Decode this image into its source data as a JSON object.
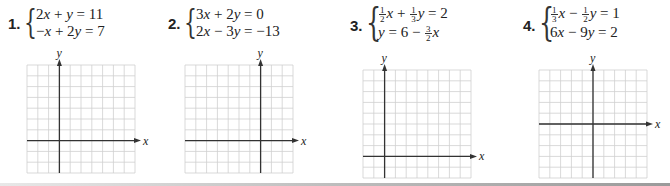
{
  "problems": [
    {
      "number": "1.",
      "equations": [
        {
          "parts": [
            "2",
            "x",
            " + ",
            "y",
            " = 11"
          ]
        },
        {
          "parts": [
            "−",
            "x",
            " + 2",
            "y",
            " = 7"
          ]
        }
      ],
      "graph": {
        "x_label": "x",
        "y_label": "y",
        "cols": 10,
        "rows": 10,
        "y_axis_col": 3,
        "x_axis_row": 7
      }
    },
    {
      "number": "2.",
      "equations": [
        {
          "parts": [
            "3",
            "x",
            " + 2",
            "y",
            " = 0"
          ]
        },
        {
          "parts": [
            "2",
            "x",
            " − 3",
            "y",
            " = −13"
          ]
        }
      ],
      "graph": {
        "x_label": "x",
        "y_label": "y",
        "cols": 10,
        "rows": 10,
        "y_axis_col": 7,
        "x_axis_row": 7
      }
    },
    {
      "number": "3.",
      "equations": [
        {
          "frac1": {
            "n": "1",
            "d": "2"
          },
          "v1": "x",
          "op": " + ",
          "frac2": {
            "n": "1",
            "d": "3"
          },
          "v2": "y",
          "rhs": " = 2"
        },
        {
          "lhs": "y",
          "mid": " = 6 − ",
          "frac": {
            "n": "3",
            "d": "2"
          },
          "v": "x"
        }
      ],
      "graph": {
        "x_label": "x",
        "y_label": "y",
        "cols": 10,
        "rows": 10,
        "y_axis_col": 2,
        "x_axis_row": 8
      }
    },
    {
      "number": "4.",
      "equations": [
        {
          "frac1": {
            "n": "1",
            "d": "3"
          },
          "v1": "x",
          "op": " − ",
          "frac2": {
            "n": "1",
            "d": "2"
          },
          "v2": "y",
          "rhs": " = 1"
        },
        {
          "parts": [
            "6",
            "x",
            " − 9",
            "y",
            " = 2"
          ]
        }
      ],
      "graph": {
        "x_label": "x",
        "y_label": "y",
        "cols": 10,
        "rows": 10,
        "y_axis_col": 5,
        "x_axis_row": 5
      }
    }
  ],
  "colors": {
    "grid_line": "#cfcfcf",
    "axis": "#333333",
    "text": "#222222"
  }
}
